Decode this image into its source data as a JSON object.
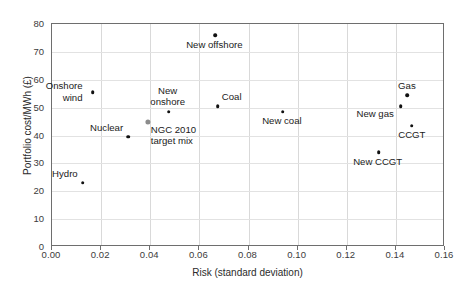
{
  "chart_data": {
    "type": "scatter",
    "title": "",
    "xlabel": "Risk (standard deviation)",
    "ylabel": "Portfolio cost/MWh (£)",
    "xlim": [
      0.0,
      0.16
    ],
    "ylim": [
      0,
      80
    ],
    "xticks": [
      "0.00",
      "0.02",
      "0.04",
      "0.06",
      "0.08",
      "0.10",
      "0.12",
      "0.14",
      "0.16"
    ],
    "xtick_values": [
      0.0,
      0.02,
      0.04,
      0.06,
      0.08,
      0.1,
      0.12,
      0.14,
      0.16
    ],
    "yticks": [
      "0",
      "10",
      "20",
      "30",
      "40",
      "50",
      "60",
      "70",
      "80"
    ],
    "ytick_values": [
      0,
      10,
      20,
      30,
      40,
      50,
      60,
      70,
      80
    ],
    "grid": true,
    "legend": "none",
    "marker_color": "#111111",
    "highlight_color": "#8c8c8c",
    "points": [
      {
        "label": "Hydro",
        "x": 0.0125,
        "y": 23.0,
        "color": "#111111",
        "style": "black",
        "label_pos": "above-left",
        "label_dx": -4,
        "label_dy": -14
      },
      {
        "label": "Onshore\nwind",
        "x": 0.0165,
        "y": 55.5,
        "color": "#111111",
        "style": "black",
        "label_pos": "left",
        "label_dx": -9,
        "label_dy": -11
      },
      {
        "label": "Nuclear",
        "x": 0.031,
        "y": 39.5,
        "color": "#111111",
        "style": "black",
        "label_pos": "above-left",
        "label_dx": -4,
        "label_dy": -14
      },
      {
        "label": "NGC 2010\ntarget mix",
        "x": 0.039,
        "y": 45.0,
        "color": "#8c8c8c",
        "style": "gray",
        "label_pos": "below-right",
        "label_dx": 4,
        "label_dy": 3
      },
      {
        "label": "New\nonshore",
        "x": 0.0475,
        "y": 48.5,
        "color": "#111111",
        "style": "black",
        "label_pos": "above",
        "label_dx": 0,
        "label_dy": -26
      },
      {
        "label": "New offshore",
        "x": 0.0665,
        "y": 76.0,
        "color": "#111111",
        "style": "black",
        "label_pos": "below",
        "label_dx": 0,
        "label_dy": 5
      },
      {
        "label": "Coal",
        "x": 0.0675,
        "y": 50.5,
        "color": "#111111",
        "style": "black",
        "label_pos": "above-right",
        "label_dx": 5,
        "label_dy": -14
      },
      {
        "label": "New coal",
        "x": 0.094,
        "y": 48.5,
        "color": "#111111",
        "style": "black",
        "label_pos": "below",
        "label_dx": 0,
        "label_dy": 4
      },
      {
        "label": "New CCGT",
        "x": 0.133,
        "y": 34.0,
        "color": "#111111",
        "style": "black",
        "label_pos": "below",
        "label_dx": 0,
        "label_dy": 5
      },
      {
        "label": "New gas",
        "x": 0.142,
        "y": 50.5,
        "color": "#111111",
        "style": "black",
        "label_pos": "below-left",
        "label_dx": -6,
        "label_dy": 3
      },
      {
        "label": "Gas",
        "x": 0.1445,
        "y": 54.5,
        "color": "#111111",
        "style": "black",
        "label_pos": "above",
        "label_dx": 1,
        "label_dy": -14
      },
      {
        "label": "CCGT",
        "x": 0.1465,
        "y": 43.5,
        "color": "#111111",
        "style": "black",
        "label_pos": "below",
        "label_dx": 1,
        "label_dy": 4
      }
    ]
  }
}
